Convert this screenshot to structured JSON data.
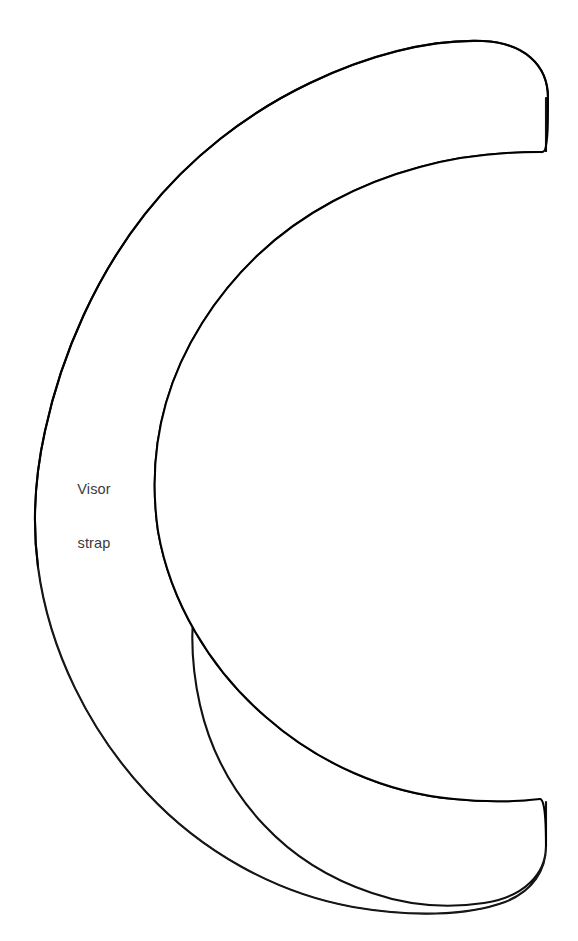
{
  "document": {
    "kind": "sewing-pattern-piece",
    "background_color": "#ffffff",
    "width": 578,
    "height": 941
  },
  "pattern": {
    "piece_label": {
      "line1": "Visor",
      "line2": "strap",
      "full_text": "Visor strap",
      "color": "#3b3b3b",
      "position_x": 93,
      "position_y": 468
    },
    "outline": {
      "stroke_color": "#111111",
      "fill_color": "#ffffff",
      "shape_name": "c-shaped-visor-strap",
      "opening_direction": "right",
      "stroke_width_main": 2.1,
      "stroke_width_thin": 1.15,
      "outer_path": "M 548 96 C 548 62 524 42 484 41 C 430 40 368 56 312 82 C 248 112 190 156 146 212 C 98 272 62 350 44 430 C 34 474 32 520 38 566 C 48 648 88 730 146 792 C 200 850 274 892 352 906 C 410 916 466 916 504 902 C 534 890 546 868 546 846",
      "inner_path": "M 540 152 C 540 152 470 152 420 166 C 360 182 302 212 258 254 C 216 294 182 346 166 402 C 154 444 152 488 158 530 C 170 600 210 668 266 716 C 318 762 386 792 454 798 C 492 802 522 800 540 798",
      "cap_top_path": "M 546 846 C 546 874 524 896 484 902",
      "notes": "closed outline: outer arc, bottom rounded cap, inner arc, top rounded cap"
    },
    "anchors": {
      "outer_leftmost_x": 36,
      "outer_leftmost_y": 470,
      "inner_leftmost_x": 152,
      "inner_leftmost_y": 474,
      "band_width_at_left": 116,
      "top_cap_right_x": 548,
      "top_cap_top_y": 41,
      "top_cap_bottom_y": 155,
      "bottom_cap_right_x": 546,
      "bottom_cap_top_y": 800,
      "bottom_cap_bottom_y": 912
    }
  }
}
